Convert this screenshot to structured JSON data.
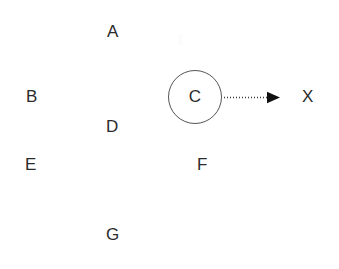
{
  "diagram": {
    "title": "",
    "background_color": "#ffffff",
    "text_color": "#2b2b2b",
    "stroke_color": "#555555",
    "arrow_color": "#1a1a1a",
    "nodes": [
      {
        "id": "A",
        "label": "A",
        "shape": "text",
        "x": 113,
        "y": 32
      },
      {
        "id": "B",
        "label": "B",
        "shape": "text",
        "x": 32,
        "y": 97
      },
      {
        "id": "C",
        "label": "C",
        "shape": "circle",
        "x": 195,
        "y": 97,
        "radius": 27
      },
      {
        "id": "D",
        "label": "D",
        "shape": "text",
        "x": 113,
        "y": 127
      },
      {
        "id": "E",
        "label": "E",
        "shape": "text",
        "x": 31,
        "y": 165
      },
      {
        "id": "F",
        "label": "F",
        "shape": "text",
        "x": 203,
        "y": 165
      },
      {
        "id": "G",
        "label": "G",
        "shape": "text",
        "x": 113,
        "y": 235
      },
      {
        "id": "X",
        "label": "X",
        "shape": "text",
        "x": 308,
        "y": 97
      }
    ],
    "edges": [
      {
        "id": "C-to-X",
        "from": "C",
        "to": "X",
        "style": "dotted",
        "arrowhead": "filled-triangle",
        "label": ""
      }
    ]
  }
}
